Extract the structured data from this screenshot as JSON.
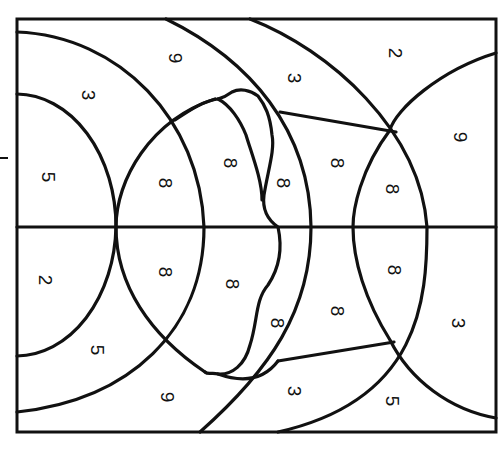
{
  "diagram": {
    "type": "paint-by-number region map",
    "stroke_color": "#111111",
    "background": "#ffffff",
    "label_rotation_deg": 90,
    "regions": [
      {
        "id": "r1",
        "label": "5",
        "x": 48,
        "y": 177
      },
      {
        "id": "r2",
        "label": "3",
        "x": 88,
        "y": 95
      },
      {
        "id": "r3",
        "label": "9",
        "x": 175,
        "y": 58
      },
      {
        "id": "r4",
        "label": "8",
        "x": 165,
        "y": 183
      },
      {
        "id": "r5",
        "label": "8",
        "x": 230,
        "y": 163
      },
      {
        "id": "r6",
        "label": "8",
        "x": 283,
        "y": 183
      },
      {
        "id": "r7",
        "label": "3",
        "x": 294,
        "y": 78
      },
      {
        "id": "r8",
        "label": "8",
        "x": 337,
        "y": 163
      },
      {
        "id": "r9",
        "label": "2",
        "x": 395,
        "y": 53
      },
      {
        "id": "r10",
        "label": "8",
        "x": 392,
        "y": 189
      },
      {
        "id": "r11",
        "label": "9",
        "x": 460,
        "y": 137
      },
      {
        "id": "r12",
        "label": "2",
        "x": 45,
        "y": 280
      },
      {
        "id": "r13",
        "label": "5",
        "x": 97,
        "y": 350
      },
      {
        "id": "r14",
        "label": "9",
        "x": 167,
        "y": 397
      },
      {
        "id": "r15",
        "label": "8",
        "x": 165,
        "y": 272
      },
      {
        "id": "r16",
        "label": "8",
        "x": 232,
        "y": 284
      },
      {
        "id": "r17",
        "label": "8",
        "x": 277,
        "y": 323
      },
      {
        "id": "r18",
        "label": "3",
        "x": 294,
        "y": 391
      },
      {
        "id": "r19",
        "label": "8",
        "x": 337,
        "y": 311
      },
      {
        "id": "r20",
        "label": "8",
        "x": 394,
        "y": 270
      },
      {
        "id": "r21",
        "label": "3",
        "x": 458,
        "y": 323
      },
      {
        "id": "r22",
        "label": "5",
        "x": 392,
        "y": 401
      }
    ]
  },
  "margin_tick": {
    "x1": 0,
    "x2": 8,
    "y": 158
  }
}
